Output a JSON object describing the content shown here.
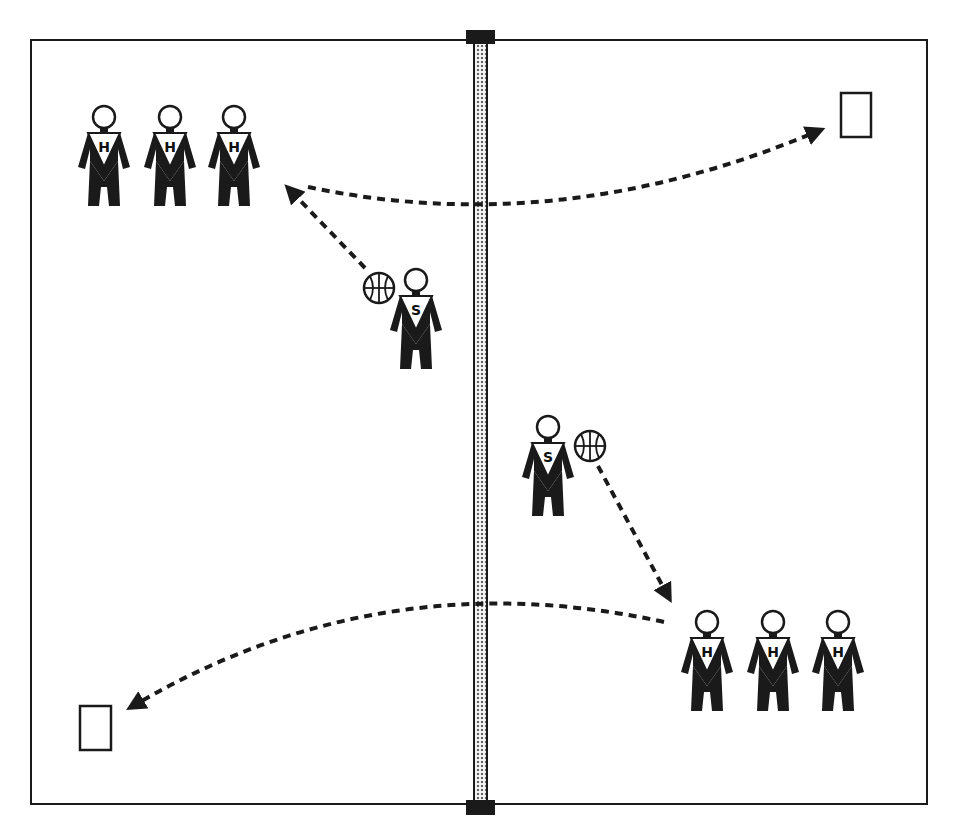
{
  "diagram": {
    "type": "court-drill",
    "court": {
      "x": 31,
      "y": 40,
      "w": 896,
      "h": 764,
      "stroke": "#1a1a1a"
    },
    "net": {
      "x": 480,
      "top": 36,
      "bottom": 808,
      "width": 12,
      "fill": "#d8d8d8",
      "post_color": "#1a1a1a"
    },
    "colors": {
      "ink": "#1a1a1a",
      "paper": "#ffffff"
    },
    "players": [
      {
        "id": "h-left-1",
        "label": "H",
        "x": 104,
        "y": 105
      },
      {
        "id": "h-left-2",
        "label": "H",
        "x": 170,
        "y": 105
      },
      {
        "id": "h-left-3",
        "label": "H",
        "x": 234,
        "y": 105
      },
      {
        "id": "s-left",
        "label": "S",
        "x": 416,
        "y": 268,
        "ball": {
          "x": 379,
          "y": 288
        }
      },
      {
        "id": "s-right",
        "label": "S",
        "x": 548,
        "y": 415,
        "ball": {
          "x": 590,
          "y": 446
        }
      },
      {
        "id": "h-right-1",
        "label": "H",
        "x": 707,
        "y": 610
      },
      {
        "id": "h-right-2",
        "label": "H",
        "x": 773,
        "y": 610
      },
      {
        "id": "h-right-3",
        "label": "H",
        "x": 838,
        "y": 610
      }
    ],
    "targets": [
      {
        "id": "target-top-right",
        "x": 841,
        "y": 93,
        "w": 30,
        "h": 44
      },
      {
        "id": "target-bottom-left",
        "x": 80,
        "y": 706,
        "w": 31,
        "h": 44
      }
    ],
    "arrows": [
      {
        "id": "pass-to-left-hitters",
        "d": "M 365 268 L 290 190",
        "head": [
          283,
          182
        ]
      },
      {
        "id": "hit-to-right-target",
        "d": "M 308 187 Q 560 240 818 131",
        "head": [
          828,
          126
        ]
      },
      {
        "id": "pass-to-right-hitters",
        "d": "M 598 466 L 668 596",
        "head": [
          675,
          607
        ]
      },
      {
        "id": "hit-to-left-target",
        "d": "M 664 622 Q 380 560 133 706",
        "head": [
          122,
          713
        ]
      }
    ]
  }
}
